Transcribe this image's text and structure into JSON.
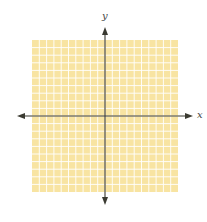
{
  "diagram": {
    "type": "coordinate-plane",
    "x_axis_label": "x",
    "y_axis_label": "y",
    "grid": {
      "columns": 20,
      "rows": 20,
      "left": 32,
      "top": 40,
      "right": 178,
      "bottom": 192,
      "fill_color": "#F8E4A2",
      "line_color": "#FFFFFF"
    },
    "axes": {
      "origin_x": 105,
      "origin_y": 116,
      "x_start": 17,
      "x_end": 193,
      "y_start": 27,
      "y_end": 205,
      "color": "#3a3a32"
    }
  }
}
